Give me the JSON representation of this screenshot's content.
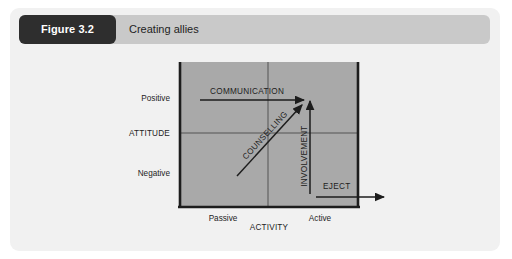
{
  "card": {
    "background_color": "#f1f1f1"
  },
  "header": {
    "badge_label": "Figure 3.2",
    "badge_color": "#2e2e2e",
    "bar_color": "#c9c9c9",
    "title": "Creating allies"
  },
  "diagram": {
    "plot_color": "#a9a9a9",
    "line_color": "#1d1d1d",
    "y_axis": {
      "name": "ATTITUDE",
      "high_label": "Positive",
      "low_label": "Negative"
    },
    "x_axis": {
      "name": "ACTIVITY",
      "low_label": "Passive",
      "high_label": "Active"
    },
    "flows": [
      {
        "label": "COMMUNICATION",
        "direction": "horizontal-right"
      },
      {
        "label": "COUNSELLING",
        "direction": "diagonal-up-right"
      },
      {
        "label": "INVOLVEMENT",
        "direction": "vertical-up"
      },
      {
        "label": "EJECT",
        "direction": "horizontal-right-exit"
      }
    ]
  }
}
